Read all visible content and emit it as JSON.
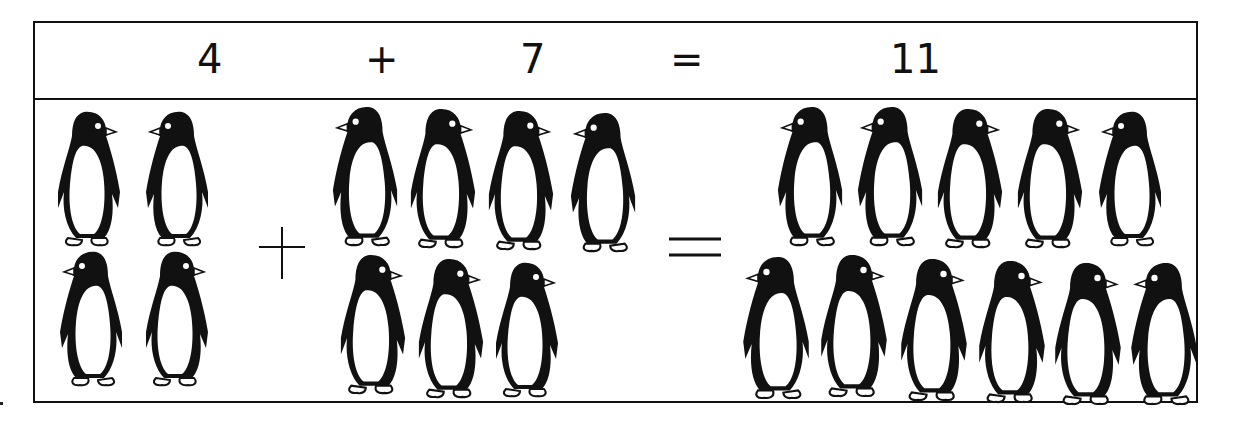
{
  "equation": {
    "addend_a": "4",
    "plus": "+",
    "addend_b": "7",
    "equals": "=",
    "sum": "11"
  },
  "groups": {
    "addend_a": {
      "count": 4,
      "rows": [
        2,
        2
      ],
      "icon": "penguin-icon"
    },
    "addend_b": {
      "count": 7,
      "rows": [
        4,
        3
      ],
      "icon": "penguin-icon"
    },
    "sum": {
      "count": 11,
      "rows": [
        5,
        6
      ],
      "icon": "penguin-icon"
    }
  },
  "operators": {
    "plus_icon": "plus-sign-icon",
    "equals_icon": "equals-sign-icon"
  },
  "colors": {
    "ink": "#111111",
    "paper": "#ffffff"
  }
}
